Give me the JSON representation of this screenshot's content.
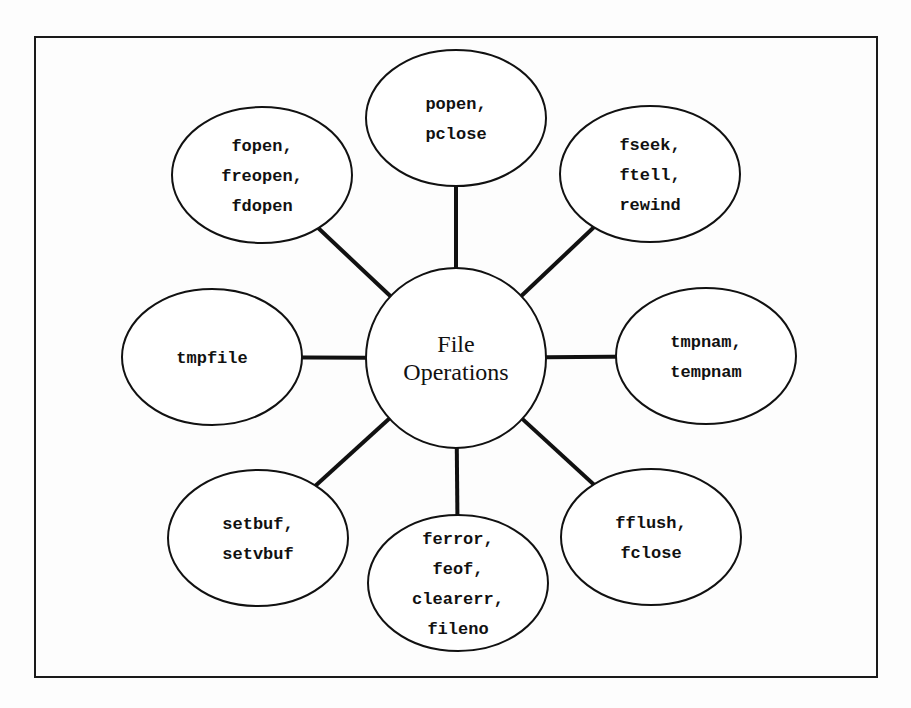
{
  "diagram": {
    "center": {
      "lines": [
        "File",
        "Operations"
      ],
      "cx": 456,
      "cy": 358,
      "r": 90
    },
    "nodes": [
      {
        "id": "popen",
        "lines": [
          "popen,",
          "pclose"
        ],
        "cx": 456,
        "cy": 118,
        "rx": 90,
        "ry": 68
      },
      {
        "id": "fseek",
        "lines": [
          "fseek,",
          "ftell,",
          "rewind"
        ],
        "cx": 650,
        "cy": 174,
        "rx": 90,
        "ry": 68
      },
      {
        "id": "tmpnam",
        "lines": [
          "tmpnam,",
          "tempnam"
        ],
        "cx": 706,
        "cy": 356,
        "rx": 90,
        "ry": 68
      },
      {
        "id": "fflush",
        "lines": [
          "fflush,",
          "fclose"
        ],
        "cx": 651,
        "cy": 537,
        "rx": 90,
        "ry": 68
      },
      {
        "id": "ferror",
        "lines": [
          "ferror,",
          "feof,",
          "clearerr,",
          "fileno"
        ],
        "cx": 458,
        "cy": 583,
        "rx": 90,
        "ry": 68
      },
      {
        "id": "setbuf",
        "lines": [
          "setbuf,",
          "setvbuf"
        ],
        "cx": 258,
        "cy": 538,
        "rx": 90,
        "ry": 68
      },
      {
        "id": "tmpfile",
        "lines": [
          "tmpfile"
        ],
        "cx": 212,
        "cy": 357,
        "rx": 90,
        "ry": 68
      },
      {
        "id": "fopen",
        "lines": [
          "fopen,",
          "freopen,",
          "fdopen"
        ],
        "cx": 262,
        "cy": 175,
        "rx": 90,
        "ry": 68
      }
    ],
    "frame": {
      "x": 35,
      "y": 37,
      "width": 842,
      "height": 640
    },
    "colors": {
      "stroke": "#111111",
      "background": "#ffffff"
    }
  }
}
